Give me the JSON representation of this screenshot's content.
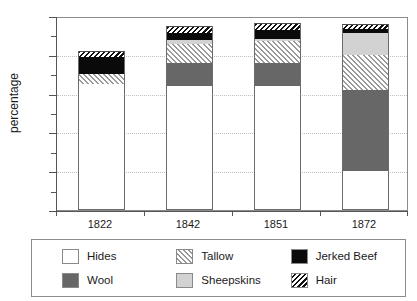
{
  "chart_data": {
    "type": "bar",
    "subtype": "stacked-bar",
    "title": "",
    "xlabel": "",
    "ylabel": "percentage",
    "categories": [
      "1822",
      "1842",
      "1851",
      "1872"
    ],
    "ylim": [
      0,
      100
    ],
    "yticks": [
      0,
      20,
      40,
      60,
      80,
      100
    ],
    "ytick_labels": [
      "0",
      "20",
      "40",
      "60",
      "80",
      "100"
    ],
    "minor_ytick_step": 10,
    "grid": "horizontal-dotted",
    "legend_position": "bottom",
    "series": [
      {
        "name": "Hides",
        "key": "hides",
        "fill": "#ffffff",
        "pattern": "solid",
        "values": [
          65,
          64,
          64,
          20
        ]
      },
      {
        "name": "Wool",
        "key": "wool",
        "fill": "#676767",
        "pattern": "solid",
        "values": [
          0,
          12,
          12,
          42
        ]
      },
      {
        "name": "Tallow",
        "key": "tallow",
        "fill": "#ffffff",
        "pattern": "hatch-fwd",
        "values": [
          5,
          9.5,
          11,
          18
        ]
      },
      {
        "name": "Sheepskins",
        "key": "sheepskins",
        "fill": "#d2d2d2",
        "pattern": "solid",
        "values": [
          0,
          2,
          1,
          11.5
        ]
      },
      {
        "name": "Jerked Beef",
        "key": "jerkedbeef",
        "fill": "#0a0a0a",
        "pattern": "solid",
        "values": [
          9,
          3.5,
          5,
          2
        ]
      },
      {
        "name": "Hair",
        "key": "hair",
        "fill": "#111111",
        "pattern": "hatch-back",
        "values": [
          3,
          4,
          3.5,
          2.5
        ]
      }
    ],
    "totals": [
      82,
      95,
      96.5,
      96
    ],
    "stack_order": [
      "Hides",
      "Wool",
      "Tallow",
      "Sheepskins",
      "Jerked Beef",
      "Hair"
    ]
  },
  "legend": {
    "items": [
      {
        "label": "Hides",
        "swatch": "swatch-white"
      },
      {
        "label": "Wool",
        "swatch": "swatch-darkgray"
      },
      {
        "label": "Tallow",
        "swatch": "swatch-hatch-forward"
      },
      {
        "label": "Sheepskins",
        "swatch": "swatch-lightgray"
      },
      {
        "label": "Jerked Beef",
        "swatch": "swatch-black"
      },
      {
        "label": "Hair",
        "swatch": "swatch-hatch-backward"
      }
    ]
  },
  "colors": {
    "hides": "#ffffff",
    "wool": "#676767",
    "sheepskins": "#d2d2d2",
    "jerked_beef": "#0a0a0a",
    "tallow_hatch": "#9a9a9a",
    "hair_hatch": "#111111",
    "axis": "#555555",
    "grid": "#bfbfbf",
    "frame": "#8c8c8c"
  }
}
